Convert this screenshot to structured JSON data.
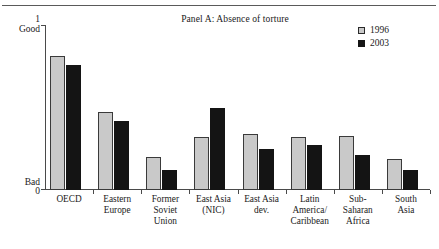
{
  "figure": {
    "title": "Panel A: Absence of torture",
    "top_rule": true
  },
  "axis": {
    "y_top_value": "1",
    "y_top_word": "Good",
    "y_bottom_value": "0",
    "y_bottom_word": "Bad"
  },
  "legend": {
    "items": [
      {
        "label": "1996",
        "color": "#c9c9c9",
        "name": "legend-1996"
      },
      {
        "label": "2003",
        "color": "#141414",
        "name": "legend-2003"
      }
    ]
  },
  "chart_data": {
    "type": "bar",
    "title": "Panel A: Absence of torture",
    "xlabel": "",
    "ylabel": "",
    "ylim": [
      0,
      1
    ],
    "grid": false,
    "legend_position": "top-right",
    "y_annotations": {
      "1": "Good",
      "0": "Bad"
    },
    "categories": [
      "OECD",
      "Eastern Europe",
      "Former Soviet Union",
      "East Asia (NIC)",
      "East Asia dev.",
      "Latin America/Caribbean",
      "Sub-Saharan Africa",
      "South Asia"
    ],
    "category_lines": [
      [
        "OECD"
      ],
      [
        "Eastern",
        "Europe"
      ],
      [
        "Former",
        "Soviet",
        "Union"
      ],
      [
        "East Asia",
        "(NIC)"
      ],
      [
        "East Asia",
        "dev."
      ],
      [
        "Latin",
        "America/",
        "Caribbean"
      ],
      [
        "Sub-",
        "Saharan",
        "Africa"
      ],
      [
        "South",
        "Asia"
      ]
    ],
    "series": [
      {
        "name": "1996",
        "color": "#c9c9c9",
        "values": [
          0.81,
          0.47,
          0.2,
          0.32,
          0.34,
          0.32,
          0.33,
          0.19
        ]
      },
      {
        "name": "2003",
        "color": "#141414",
        "values": [
          0.76,
          0.42,
          0.12,
          0.5,
          0.25,
          0.27,
          0.21,
          0.12
        ]
      }
    ]
  }
}
